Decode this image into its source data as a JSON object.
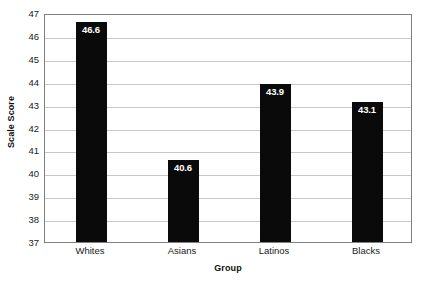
{
  "chart_data": {
    "type": "bar",
    "title": "",
    "subtitle": "",
    "xlabel": "Group",
    "ylabel": "Scale Score",
    "categories": [
      "Whites",
      "Asians",
      "Latinos",
      "Blacks"
    ],
    "values": [
      46.6,
      40.6,
      43.9,
      43.1
    ],
    "data_labels": [
      "46.6",
      "40.6",
      "43.9",
      "43.1"
    ],
    "ylim": [
      37,
      47
    ],
    "yticks": [
      47,
      46,
      45,
      44,
      43,
      42,
      41,
      40,
      39,
      38,
      37
    ],
    "ytick_labels": [
      "47",
      "46",
      "45",
      "44",
      "43",
      "42",
      "41",
      "40",
      "39",
      "38",
      "37"
    ],
    "grid": true,
    "grid_axis": "y",
    "legend": false,
    "legend_position": "none",
    "bar_color": "#0a0a0a",
    "data_label_color": "#ffffff",
    "gridline_color": "#c8c8c8",
    "axis_color": "#808080",
    "background_color": "#ffffff",
    "series": [
      {
        "name": "Scale Score",
        "values": [
          46.6,
          40.6,
          43.9,
          43.1
        ]
      }
    ]
  }
}
